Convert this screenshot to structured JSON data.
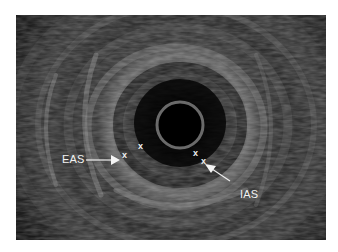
{
  "figure": {
    "type": "endoanal ultrasound image",
    "annotations": {
      "eas_label": "EAS",
      "ias_label": "IAS",
      "markers": [
        "x",
        "x",
        "x",
        "x"
      ]
    },
    "colors": {
      "background": "#ffffff",
      "image_bg": "#0b0b0b",
      "annotation": "#f2f2f2"
    }
  }
}
